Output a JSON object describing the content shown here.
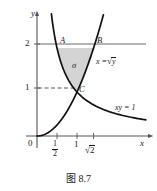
{
  "figure": {
    "caption": "图 8.7",
    "axes": {
      "x_axis_label": "x",
      "y_axis_label": "y",
      "origin_label": "0",
      "x_ticks": [
        {
          "value": 0.5,
          "label_num": "1",
          "label_den": "2",
          "kind": "fraction"
        },
        {
          "value": 1,
          "label": "1",
          "kind": "plain"
        },
        {
          "value": 1.41421,
          "label_sign": "√",
          "label_arg": "2",
          "kind": "radical"
        }
      ],
      "y_ticks": [
        {
          "value": 1,
          "label": "1"
        },
        {
          "value": 2,
          "label": "2"
        }
      ]
    },
    "points": [
      {
        "name": "A",
        "x": 0.5,
        "y": 2
      },
      {
        "name": "B",
        "x": 1.41421,
        "y": 2
      },
      {
        "name": "C",
        "x": 1,
        "y": 1
      }
    ],
    "curves": [
      {
        "name": "parabola",
        "label_lhs": "x =",
        "label_sign": "√",
        "label_arg": "y",
        "equation": "x = sqrt(y)"
      },
      {
        "name": "hyperbola",
        "label": "xy = 1",
        "equation": "xy = 1"
      }
    ],
    "region": {
      "name": "sigma",
      "label": "σ",
      "fill_color": "#d4d4d4",
      "description": "region bounded by xy=1, x=sqrt(y) and y=2"
    },
    "guides": [
      {
        "name": "y-equals-2-line",
        "style": "solid",
        "y": 2
      },
      {
        "name": "y-equals-1-dashed",
        "style": "dashed",
        "y": 1
      }
    ],
    "colors": {
      "stroke": "#111111",
      "axis": "#555555",
      "fill": "#d4d4d4"
    }
  }
}
